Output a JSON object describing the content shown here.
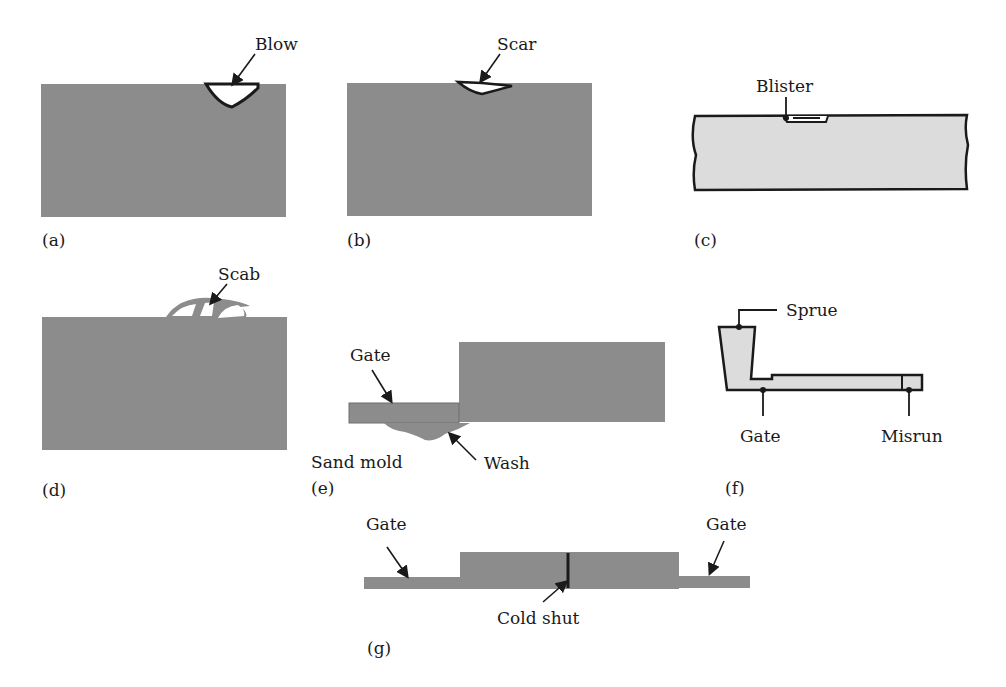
{
  "colors": {
    "casting_fill": "#8c8c8c",
    "light_fill": "#dcdcdc",
    "stroke": "#1a1a1a",
    "background": "#ffffff"
  },
  "panels": {
    "a": {
      "caption": "(a)",
      "label": "Blow"
    },
    "b": {
      "caption": "(b)",
      "label": "Scar"
    },
    "c": {
      "caption": "(c)",
      "label": "Blister"
    },
    "d": {
      "caption": "(d)",
      "label": "Scab"
    },
    "e": {
      "caption": "(e)",
      "labels": {
        "gate": "Gate",
        "sand_mold": "Sand mold",
        "wash": "Wash"
      }
    },
    "f": {
      "caption": "(f)",
      "labels": {
        "sprue": "Sprue",
        "gate": "Gate",
        "misrun": "Misrun"
      }
    },
    "g": {
      "caption": "(g)",
      "labels": {
        "gate_left": "Gate",
        "gate_right": "Gate",
        "cold_shut": "Cold shut"
      }
    }
  }
}
